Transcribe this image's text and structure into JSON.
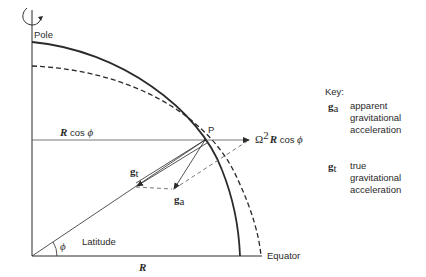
{
  "diagram": {
    "labels": {
      "pole": "Pole",
      "equator": "Equator",
      "latitude": "Latitude",
      "point": "P",
      "radius": "R",
      "r_cos_phi_bold": "R",
      "r_cos_phi_rest": " cos ",
      "phi": "ϕ",
      "angle_phi": "ϕ",
      "centrifugal_prefix": "Ω",
      "centrifugal_sup": "2",
      "centrifugal_R": "R",
      "centrifugal_rest": " cos ",
      "centrifugal_phi": "ϕ",
      "g_symbol": "g",
      "g_t_sub": "t",
      "g_a_sub": "a"
    },
    "key": {
      "title": "Key:",
      "items": [
        {
          "symbol": "g",
          "sub": "a",
          "line1": "apparent",
          "line2": "gravitational",
          "line3": "acceleration"
        },
        {
          "symbol": "g",
          "sub": "t",
          "line1": "true",
          "line2": "gravitational",
          "line3": "acceleration"
        }
      ]
    },
    "colors": {
      "stroke": "#2a2a2a",
      "thin": "#444444"
    }
  }
}
